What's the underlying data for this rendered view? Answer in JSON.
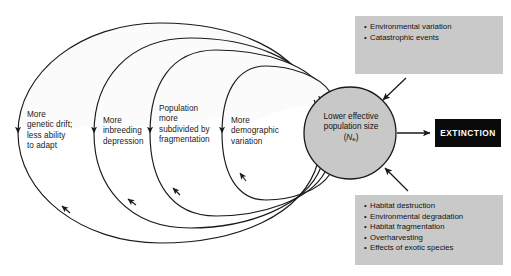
{
  "figure": {
    "background_color": "#ffffff"
  },
  "colors": {
    "ellipse_stroke": "#1a1a1a",
    "ellipse_fill": "#fbfbfb",
    "circle_fill": "#c8c8c8",
    "circle_stroke": "#1a1a1a",
    "info_box_fill": "#c9c9c9",
    "extinction_fill": "#0a0a0a",
    "extinction_text": "#ffffff",
    "text": "#111111"
  },
  "loops": [
    {
      "id": "genetic-drift",
      "label": "More\ngenetic drift;\nless ability\nto adapt"
    },
    {
      "id": "inbreeding",
      "label": "More\ninbreeding\ndepression"
    },
    {
      "id": "fragmentation",
      "label": "Population\nmore\nsubdivided by\nfragmentation"
    },
    {
      "id": "demographic",
      "label": "More\ndemographic\nvariation"
    }
  ],
  "central_node": {
    "line1": "Lower effective",
    "line2": "population size",
    "symbol_open": "(",
    "symbol_letter": "N",
    "symbol_sub": "e",
    "symbol_close": ")"
  },
  "top_box": {
    "items": [
      "Environmental variation",
      "Catastrophic events"
    ]
  },
  "bottom_box": {
    "items": [
      "Habitat destruction",
      "Environmental degradation",
      "Habitat fragmentation",
      "Overharvesting",
      "Effects of exotic species"
    ]
  },
  "outcome": {
    "label": "EXTINCTION"
  }
}
